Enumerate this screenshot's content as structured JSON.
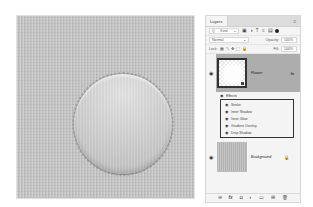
{
  "canvas": {
    "shape": "scalloped-circle",
    "background_color": "#c4c4c4",
    "shape_color": "#d4d4d4"
  },
  "layers_panel": {
    "tab_label": "Layers",
    "menu_icon": "≡",
    "filter": {
      "search_icon": "Q",
      "kind_label": "Kind",
      "dropdown_arrow": "⌄",
      "icons": [
        "▣",
        "◑",
        "T",
        "⌗",
        "▤"
      ]
    },
    "blend": {
      "mode": "Normal",
      "dropdown_arrow": "⌄",
      "opacity_label": "Opacity:",
      "opacity_value": "100%"
    },
    "lock": {
      "label": "Lock:",
      "icons": [
        "▦",
        "✎",
        "✥",
        "⬚",
        "🔒"
      ],
      "fill_label": "Fill:",
      "fill_value": "100%"
    },
    "layers": [
      {
        "name": "Flower",
        "selected": true,
        "visible_icon": "◉",
        "fx_label": "fx",
        "fx_arrow": "⌄",
        "effects_label": "Effects",
        "effects": [
          {
            "name": "Stroke"
          },
          {
            "name": "Inner Shadow"
          },
          {
            "name": "Inner Glow"
          },
          {
            "name": "Gradient Overlay"
          },
          {
            "name": "Drop Shadow"
          }
        ]
      },
      {
        "name": "Background",
        "selected": false,
        "visible_icon": "◉",
        "lock_icon": "🔒"
      }
    ],
    "footer_icons": [
      "⊖",
      "fx",
      "◘",
      "◐",
      "▭",
      "⊞",
      "🗑"
    ]
  }
}
